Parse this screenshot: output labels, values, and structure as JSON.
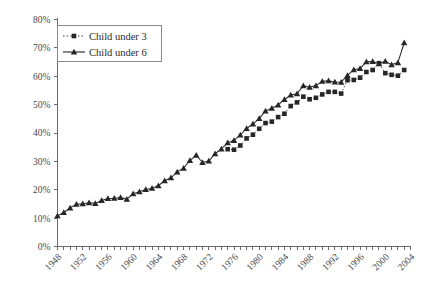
{
  "chart_data": {
    "type": "line",
    "title": "",
    "subtitle": "",
    "xlabel": "",
    "ylabel": "",
    "xlim": [
      1948,
      2004
    ],
    "ylim": [
      0,
      0.8
    ],
    "grid": false,
    "legend_position": "top-left",
    "y_tick_labels": [
      "0%",
      "10%",
      "20%",
      "30%",
      "40%",
      "50%",
      "60%",
      "70%",
      "80%"
    ],
    "y_tick_values": [
      0,
      10,
      20,
      30,
      40,
      50,
      60,
      70,
      80
    ],
    "x_tick_labels": [
      "1948",
      "1952",
      "1956",
      "1960",
      "1964",
      "1968",
      "1972",
      "1976",
      "1980",
      "1984",
      "1988",
      "1992",
      "1996",
      "2000",
      "2004"
    ],
    "x_tick_values": [
      1948,
      1952,
      1956,
      1960,
      1964,
      1968,
      1972,
      1976,
      1980,
      1984,
      1988,
      1992,
      1996,
      2000,
      2004
    ],
    "x_minor_step": 1,
    "series": [
      {
        "name": "Child under 3",
        "marker": "square",
        "linestyle": "dotted",
        "color": "#262626",
        "x": [
          1975,
          1976,
          1977,
          1978,
          1979,
          1980,
          1981,
          1982,
          1983,
          1984,
          1985,
          1986,
          1987,
          1988,
          1989,
          1990,
          1991,
          1992,
          1993,
          1994,
          1995,
          1996,
          1997,
          1998,
          1999,
          2000,
          2001,
          2002,
          2003
        ],
        "values": [
          34.3,
          34.1,
          35.6,
          38.1,
          39.4,
          41.5,
          43.5,
          44.0,
          45.6,
          46.8,
          49.5,
          50.8,
          52.8,
          51.9,
          52.4,
          53.6,
          54.5,
          54.5,
          53.9,
          58.6,
          58.7,
          59.5,
          61.5,
          62.2,
          64.6,
          61.1,
          60.5,
          60.2,
          62.2
        ]
      },
      {
        "name": "Child under 6",
        "marker": "triangle",
        "linestyle": "solid",
        "color": "#262626",
        "x": [
          1948,
          1949,
          1950,
          1951,
          1952,
          1953,
          1954,
          1955,
          1956,
          1957,
          1958,
          1959,
          1960,
          1961,
          1962,
          1963,
          1964,
          1965,
          1966,
          1967,
          1968,
          1969,
          1970,
          1971,
          1972,
          1973,
          1974,
          1975,
          1976,
          1977,
          1978,
          1979,
          1980,
          1981,
          1982,
          1983,
          1984,
          1985,
          1986,
          1987,
          1988,
          1989,
          1990,
          1991,
          1992,
          1993,
          1994,
          1995,
          1996,
          1997,
          1998,
          1999,
          2000,
          2001,
          2002,
          2003
        ],
        "values": [
          10.8,
          12.0,
          13.6,
          14.9,
          15.1,
          15.4,
          15.2,
          16.2,
          16.9,
          17.0,
          17.3,
          16.7,
          18.6,
          19.3,
          20.1,
          20.5,
          21.4,
          23.2,
          24.2,
          26.3,
          27.6,
          30.3,
          32.2,
          29.6,
          30.1,
          32.7,
          34.4,
          36.6,
          37.4,
          39.3,
          41.6,
          43.2,
          45.1,
          47.8,
          48.7,
          49.9,
          51.8,
          53.4,
          53.8,
          56.7,
          56.1,
          56.7,
          58.2,
          58.4,
          58.0,
          57.9,
          60.3,
          62.3,
          62.7,
          65.1,
          65.2,
          64.4,
          65.3,
          64.1,
          64.8,
          71.8
        ]
      }
    ]
  },
  "legend": {
    "items": [
      {
        "label": "Child under 3",
        "marker": "square",
        "linestyle": "dotted"
      },
      {
        "label": "Child under 6",
        "marker": "triangle",
        "linestyle": "solid"
      }
    ]
  },
  "colors": {
    "axis": "#6b6b6b",
    "tick_text": "#4a4a4a",
    "series": "#262626",
    "legend_border": "#8a8a8a",
    "background": "#ffffff"
  }
}
